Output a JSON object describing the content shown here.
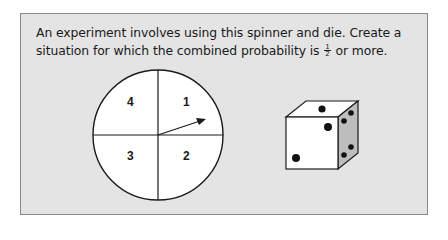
{
  "problem": {
    "text_before_fraction": "An experiment involves using this spinner and die. Create a situation for which the combined probability is ",
    "fraction": {
      "numerator": "1",
      "denominator": "2"
    },
    "text_after_fraction": " or more."
  },
  "spinner": {
    "sections": [
      {
        "label": "4",
        "position": "top-left"
      },
      {
        "label": "1",
        "position": "top-right"
      },
      {
        "label": "3",
        "position": "bottom-left"
      },
      {
        "label": "2",
        "position": "bottom-right"
      }
    ],
    "arrow_points_to": "1"
  },
  "die": {
    "front_face_pips": 2,
    "top_face_pips": 1,
    "side_face_pips": 4
  }
}
